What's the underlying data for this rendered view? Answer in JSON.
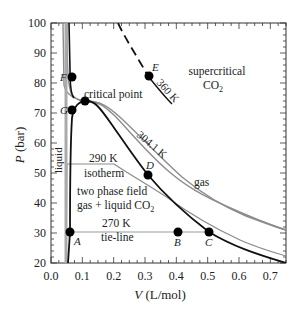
{
  "chart_data": {
    "type": "line",
    "title": "",
    "xlabel": "V (L/mol)",
    "ylabel": "P (bar)",
    "xlim": [
      0.0,
      0.75
    ],
    "ylim": [
      20,
      100
    ],
    "x_ticks": [
      "0.0",
      "0.1",
      "0.2",
      "0.3",
      "0.4",
      "0.5",
      "0.6",
      "0.7"
    ],
    "y_ticks": [
      "20",
      "30",
      "40",
      "50",
      "60",
      "70",
      "80",
      "90",
      "100"
    ],
    "grid": false,
    "series": [
      {
        "name": "270 K isotherm",
        "style": "solid-black",
        "points": [
          [
            0.046,
            20
          ],
          [
            0.05,
            31.5
          ],
          [
            0.5,
            31.5
          ],
          [
            0.55,
            29.5
          ],
          [
            0.6,
            27.5
          ],
          [
            0.65,
            25.5
          ],
          [
            0.7,
            23.5
          ],
          [
            0.75,
            22
          ]
        ]
      },
      {
        "name": "290 K isotherm",
        "style": "solid-gray",
        "points": [
          [
            0.048,
            20
          ],
          [
            0.052,
            53
          ],
          [
            0.2,
            53
          ],
          [
            0.35,
            42
          ],
          [
            0.45,
            36
          ],
          [
            0.55,
            31
          ],
          [
            0.65,
            27
          ],
          [
            0.75,
            24
          ]
        ]
      },
      {
        "name": "304.1 K",
        "style": "solid-gray",
        "points": [
          [
            0.052,
            100
          ],
          [
            0.056,
            80
          ],
          [
            0.07,
            75
          ],
          [
            0.094,
            73.8
          ],
          [
            0.12,
            73.5
          ],
          [
            0.2,
            66
          ],
          [
            0.3,
            54
          ],
          [
            0.4,
            44
          ],
          [
            0.5,
            37
          ],
          [
            0.6,
            31.5
          ],
          [
            0.7,
            27.5
          ],
          [
            0.75,
            26
          ]
        ]
      },
      {
        "name": "two-phase boundary (coexistence curve)",
        "style": "solid-black",
        "points": [
          [
            0.06,
            100
          ],
          [
            0.06,
            76
          ],
          [
            0.06,
            62
          ],
          [
            0.058,
            45
          ],
          [
            0.055,
            31.5
          ],
          [
            0.06,
            45
          ],
          [
            0.07,
            62
          ],
          [
            0.094,
            73.8
          ],
          [
            0.13,
            71
          ],
          [
            0.2,
            62
          ],
          [
            0.31,
            49.5
          ],
          [
            0.4,
            40
          ],
          [
            0.5,
            31.5
          ]
        ]
      },
      {
        "name": "360 K",
        "style": "dashed-black",
        "points": [
          [
            0.22,
            100
          ],
          [
            0.26,
            90
          ],
          [
            0.31,
            76.5
          ],
          [
            0.36,
            68
          ]
        ]
      }
    ],
    "points": [
      {
        "label": "A",
        "V": 0.055,
        "P": 31.5
      },
      {
        "label": "B",
        "V": 0.4,
        "P": 31.5
      },
      {
        "label": "C",
        "V": 0.5,
        "P": 31.5
      },
      {
        "label": "D",
        "V": 0.31,
        "P": 49.5
      },
      {
        "label": "E",
        "V": 0.31,
        "P": 76.5
      },
      {
        "label": "F",
        "V": 0.057,
        "P": 76.5
      },
      {
        "label": "G",
        "V": 0.057,
        "P": 62
      },
      {
        "label": "critical point",
        "V": 0.094,
        "P": 73.8
      }
    ],
    "annotations": [
      "critical point",
      "supercritical CO2",
      "360 K",
      "304.1 K",
      "290 K",
      "isotherm",
      "liquid",
      "two phase field",
      "gas + liquid CO2",
      "270 K",
      "tie-line",
      "gas"
    ]
  },
  "labels": {
    "xlabel_italic": "V",
    "xlabel_rest": " (L/mol)",
    "ylabel_italic": "P",
    "ylabel_rest": " (bar)",
    "critical_point": "critical point",
    "supercritical_1": "supercritical",
    "supercritical_2": "CO",
    "supercritical_sub": "2",
    "k360": "360 K",
    "k304": "304.1 K",
    "k290": "290 K",
    "isotherm": "isotherm",
    "liquid": "liquid",
    "two_phase_1": "two phase field",
    "two_phase_2": "gas + liquid CO",
    "two_phase_sub": "2",
    "k270": "270 K",
    "tieline": "tie-line",
    "gas": "gas",
    "A": "A",
    "B": "B",
    "C": "C",
    "D": "D",
    "E": "E",
    "F": "F",
    "G": "G"
  }
}
